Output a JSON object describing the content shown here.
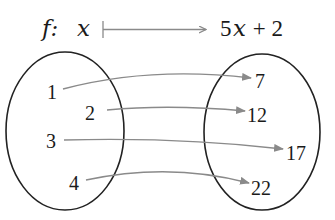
{
  "title": {
    "function_name": "f:",
    "variable": "x",
    "expression_coef": "5",
    "expression_var": "x",
    "expression_rest": " + 2",
    "maps_to_symbol": "maps-to-arrow"
  },
  "domain_set": {
    "label": "domain",
    "elements": [
      "1",
      "2",
      "3",
      "4"
    ]
  },
  "codomain_set": {
    "label": "codomain",
    "elements": [
      "7",
      "12",
      "17",
      "22"
    ]
  },
  "mappings": [
    {
      "from": "1",
      "to": "7"
    },
    {
      "from": "2",
      "to": "12"
    },
    {
      "from": "3",
      "to": "17"
    },
    {
      "from": "4",
      "to": "22"
    }
  ],
  "colors": {
    "ellipse": "#222222",
    "arrow": "#8a8a8a",
    "text": "#1a1a1a"
  }
}
